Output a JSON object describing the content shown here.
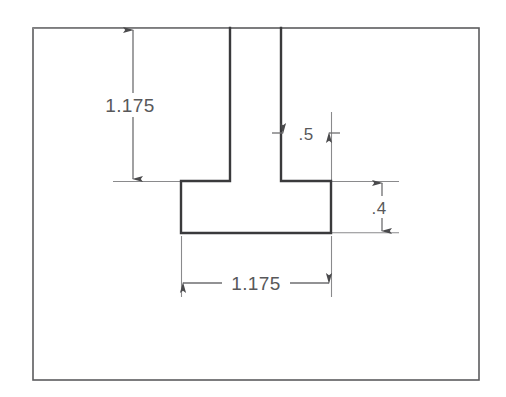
{
  "drawing": {
    "title": "Engineering dimensioned part outline",
    "type": "orthographic-section-view",
    "colors": {
      "background": "#ffffff",
      "part_outline": "#3a3a3c",
      "border": "#58585a",
      "dimension_line": "#6e6e70",
      "dimension_text": "#58585a"
    },
    "border": {
      "name": "drawing-frame",
      "x": 33,
      "y": 28,
      "width": 446,
      "height": 352
    },
    "part": {
      "name": "t-slot-block-profile",
      "description": "Rectangular block with an inverted-T shaped slot opening at the top edge",
      "outline_points": "230,28 230,181 181,181 181,233 331,233 331,181 281,181 281,28",
      "left_wall_x": 230,
      "right_wall_x": 281,
      "slot_floor_y": 181,
      "pocket_bottom_y": 233,
      "pocket_left_x": 181,
      "pocket_right_x": 331,
      "top_y": 28
    },
    "dimensions": [
      {
        "id": "dim-vertical-depth",
        "label": "1.175",
        "orientation": "vertical",
        "value": 1.175,
        "units": "in",
        "measures": "slot depth from top face to slot floor",
        "line_x": 133,
        "from_y": 28,
        "to_y": 181,
        "text_x": 130,
        "text_y": 112,
        "text_anchor": "middle"
      },
      {
        "id": "dim-horizontal-neck",
        "label": ".5",
        "orientation": "horizontal",
        "value": 0.5,
        "units": "in",
        "measures": "slot neck width",
        "line_y": 133,
        "from_x": 281,
        "to_x": 331,
        "text_x": 306,
        "text_y": 140,
        "text_anchor": "middle"
      },
      {
        "id": "dim-vertical-pocket-height",
        "label": ".4",
        "orientation": "vertical",
        "value": 0.4,
        "units": "in",
        "measures": "pocket height",
        "line_x": 382,
        "from_y": 181,
        "to_y": 233,
        "text_x": 379,
        "text_y": 214,
        "text_anchor": "middle"
      },
      {
        "id": "dim-horizontal-pocket-width",
        "label": "1.175",
        "orientation": "horizontal",
        "value": 1.175,
        "units": "in",
        "measures": "pocket width",
        "line_y": 283,
        "from_x": 181,
        "to_x": 331,
        "text_x": 256,
        "text_y": 290,
        "text_anchor": "middle"
      }
    ]
  }
}
